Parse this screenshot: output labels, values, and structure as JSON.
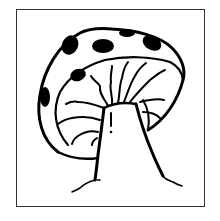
{
  "image": {
    "subject": "mushroom line drawing",
    "alt": "Black-and-white line drawing of a spotted mushroom inside a square frame",
    "colors": {
      "ink": "#000000",
      "frame": "#333333",
      "background": "#ffffff"
    }
  }
}
